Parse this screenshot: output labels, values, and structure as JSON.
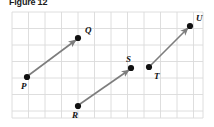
{
  "figure": {
    "title": "Figure 12",
    "caption_visible": true
  },
  "colors": {
    "background": "#ffffff",
    "grid_line": "#d9d9d9",
    "grid_border": "#cccccc",
    "vector_line": "#7d7d7d",
    "point_fill": "#111111",
    "label_text": "#111111",
    "title_text": "#1a1a1a"
  },
  "grid": {
    "x0": 12,
    "y0": 12,
    "x1": 203,
    "y1": 118,
    "cell": 16.5,
    "show_lines": true
  },
  "points": [
    {
      "name": "P",
      "x": 27,
      "y": 77,
      "label": "P",
      "label_x": 21,
      "label_y": 89
    },
    {
      "name": "Q",
      "x": 78,
      "y": 38,
      "label": "Q",
      "label_x": 85,
      "label_y": 33
    },
    {
      "name": "R",
      "x": 78,
      "y": 106,
      "label": "R",
      "label_x": 72,
      "label_y": 118
    },
    {
      "name": "S",
      "x": 131,
      "y": 68,
      "label": "S",
      "label_x": 126,
      "label_y": 62
    },
    {
      "name": "T",
      "x": 149,
      "y": 67,
      "label": "T",
      "label_x": 154,
      "label_y": 79
    },
    {
      "name": "U",
      "x": 190,
      "y": 26,
      "label": "U",
      "label_x": 196,
      "label_y": 21
    }
  ],
  "vectors": [
    {
      "name": "PQ",
      "from": "P",
      "to": "Q",
      "x1": 29,
      "y1": 75,
      "x2": 76,
      "y2": 40,
      "arrow_at_end": true
    },
    {
      "name": "RS",
      "from": "R",
      "to": "S",
      "x1": 80,
      "y1": 104,
      "x2": 129,
      "y2": 70,
      "arrow_at_end": true
    },
    {
      "name": "TU",
      "from": "T",
      "to": "U",
      "x1": 151,
      "y1": 65,
      "x2": 188,
      "y2": 28,
      "arrow_at_end": true
    }
  ]
}
